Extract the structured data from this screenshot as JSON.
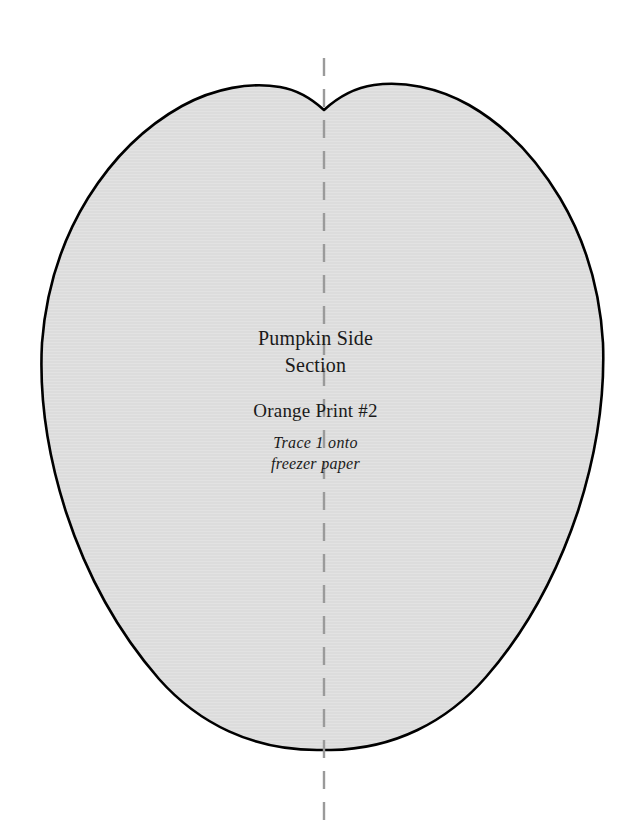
{
  "document": {
    "kind": "quilting-applique-pattern-template",
    "page_background": "#ffffff"
  },
  "pattern_piece": {
    "name": "Pumpkin Side Section",
    "fill_color": "#dcdcdc",
    "outline_color": "#000000",
    "outline_width_px": 2.6
  },
  "fold_line": {
    "orientation": "vertical",
    "color": "#9a9a9a",
    "dash_length_px": 18,
    "gap_length_px": 13,
    "center_x_px": 324
  },
  "labels": {
    "title": {
      "line1": "Pumpkin Side",
      "line2": "Section"
    },
    "fabric": "Orange Print #2",
    "instruction": {
      "line1": "Trace 1 onto",
      "line2": "freezer paper"
    }
  }
}
